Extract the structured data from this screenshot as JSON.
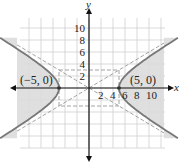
{
  "chart_data": {
    "type": "line",
    "title": "",
    "equation": "x^2/25 - y^2/9 = 1",
    "xlabel": "x",
    "ylabel": "y",
    "xlim": [
      -12,
      12
    ],
    "ylim": [
      -10,
      12
    ],
    "grid": true,
    "grid_step": 2,
    "x_ticks": [
      "2",
      "4",
      "6",
      "8",
      "10"
    ],
    "y_ticks": [
      "2",
      "4",
      "6",
      "8",
      "10"
    ],
    "vertices": [
      {
        "label": "(−5, 0)",
        "x": -5,
        "y": 0
      },
      {
        "label": "(5, 0)",
        "x": 5,
        "y": 0
      }
    ],
    "asymptotes": [
      "y = 3/5 x",
      "y = -3/5 x"
    ],
    "fundamental_rectangle": {
      "x": [
        -5,
        5
      ],
      "y": [
        -3,
        3
      ]
    },
    "shaded_region": "outside branches (|x| beyond hyperbola)",
    "colors": {
      "curve": "#777777",
      "shade": "#dcdcdc",
      "grid": "#cfcfcf",
      "axis": "#111111",
      "dashed": "#999999"
    }
  }
}
